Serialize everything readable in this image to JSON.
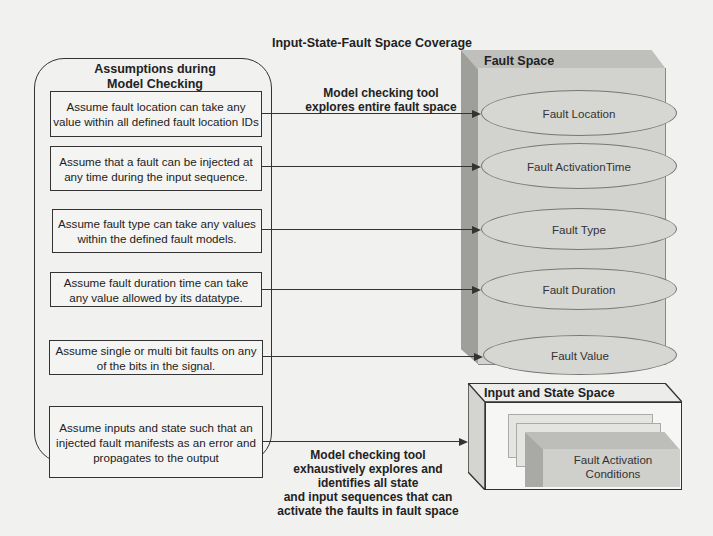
{
  "title": "Input-State-Fault Space Coverage",
  "assumptions": {
    "title_line1": "Assumptions during",
    "title_line2": "Model Checking",
    "items": [
      {
        "text": "Assume fault location can take any value within all defined fault location IDs"
      },
      {
        "text": "Assume that a fault can be injected at any time during the input sequence."
      },
      {
        "text": "Assume fault type can take any values within the defined fault models."
      },
      {
        "text": "Assume fault duration time can take any value allowed by its datatype."
      },
      {
        "text": "Assume single or multi bit faults on any of the bits in the signal."
      },
      {
        "text": "Assume inputs and state such that an injected fault manifests as an error and propagates to the output"
      }
    ]
  },
  "fault_space_caption": {
    "line1": "Model checking tool",
    "line2": "explores entire fault space"
  },
  "fault_space": {
    "title": "Fault Space",
    "items": [
      {
        "label": "Fault Location"
      },
      {
        "label": "Fault ActivationTime"
      },
      {
        "label": "Fault Type"
      },
      {
        "label": "Fault Duration"
      },
      {
        "label": "Fault Value"
      }
    ]
  },
  "input_state_caption": {
    "line1": "Model checking tool",
    "line2": "exhaustively explores and",
    "line3": "identifies all state",
    "line4": "and input sequences that can",
    "line5": "activate the faults in fault space"
  },
  "input_state_space": {
    "title": "Input and State Space",
    "inner_line1": "Fault Activation",
    "inner_line2": "Conditions"
  }
}
